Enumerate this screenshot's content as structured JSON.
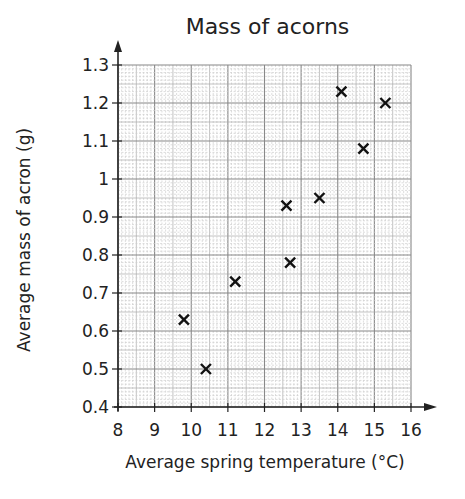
{
  "chart_data": {
    "type": "scatter",
    "title": "Mass of acorns",
    "xlabel": "Average spring temperature (°C)",
    "ylabel": "Average mass of acron (g)",
    "xlim": [
      8,
      16
    ],
    "ylim": [
      0.4,
      1.3
    ],
    "xticks": [
      "8",
      "9",
      "10",
      "11",
      "12",
      "13",
      "14",
      "15",
      "16"
    ],
    "yticks": [
      "0.4",
      "0.5",
      "0.6",
      "0.7",
      "0.8",
      "0.9",
      "1",
      "1.1",
      "1.2",
      "1.3"
    ],
    "grid": true,
    "marker": "x",
    "legend": null,
    "points": [
      {
        "x": 9.8,
        "y": 0.63
      },
      {
        "x": 10.4,
        "y": 0.5
      },
      {
        "x": 11.2,
        "y": 0.73
      },
      {
        "x": 12.6,
        "y": 0.93
      },
      {
        "x": 12.7,
        "y": 0.78
      },
      {
        "x": 13.5,
        "y": 0.95
      },
      {
        "x": 14.1,
        "y": 1.23
      },
      {
        "x": 14.7,
        "y": 1.08
      },
      {
        "x": 15.3,
        "y": 1.2
      }
    ]
  }
}
